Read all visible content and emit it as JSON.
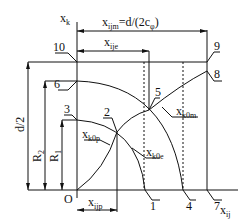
{
  "diagram": {
    "axes": {
      "vertical": {
        "main": "x",
        "sub": "k"
      },
      "horizontal": {
        "main": "x",
        "sub": "ij"
      },
      "origin": "O"
    },
    "dimensions": {
      "xijm": {
        "main": "x",
        "sub": "ijm",
        "rest": "=d/(2c",
        "phi": "φ",
        "close": ")"
      },
      "xije": {
        "main": "x",
        "sub": "ije"
      },
      "xijp": {
        "main": "x",
        "sub": "ijp"
      },
      "d2": "d/2",
      "R2": {
        "main": "R",
        "sub": "2"
      },
      "R1": {
        "main": "R",
        "sub": "1"
      }
    },
    "curves": {
      "xk0p": {
        "main": "x",
        "sub": "k0p"
      },
      "xk0e": {
        "main": "x",
        "sub": "k0e"
      },
      "xk0m": {
        "main": "x",
        "sub": "k0m"
      }
    },
    "points": [
      "1",
      "2",
      "3",
      "4",
      "5",
      "6",
      "7",
      "8",
      "9",
      "10"
    ]
  }
}
